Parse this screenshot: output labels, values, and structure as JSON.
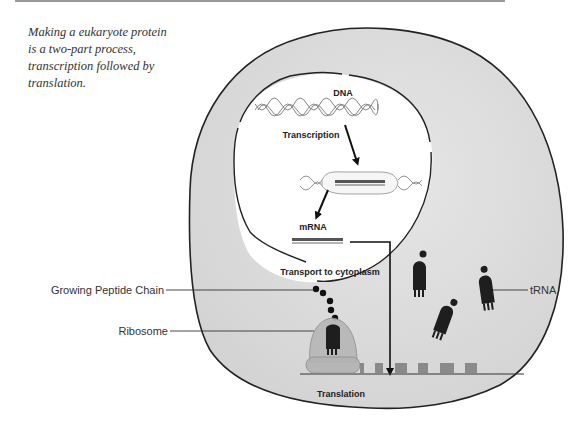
{
  "caption": "Making a eukaryote protein is a two-part process, transcription followed by translation.",
  "labels": {
    "dna": "DNA",
    "transcription": "Transcription",
    "mrna": "mRNA",
    "transport": "Transport to cytoplasm",
    "translation": "Translation",
    "growing_peptide_chain": "Growing Peptide Chain",
    "ribosome": "Ribosome",
    "trna": "tRNA"
  },
  "colors": {
    "cytoplasm": "#dcdcdc",
    "nucleus": "#ffffff",
    "membrane": "#222222",
    "ribosome": "#b8b8b8",
    "trna": "#1e1e1e"
  }
}
